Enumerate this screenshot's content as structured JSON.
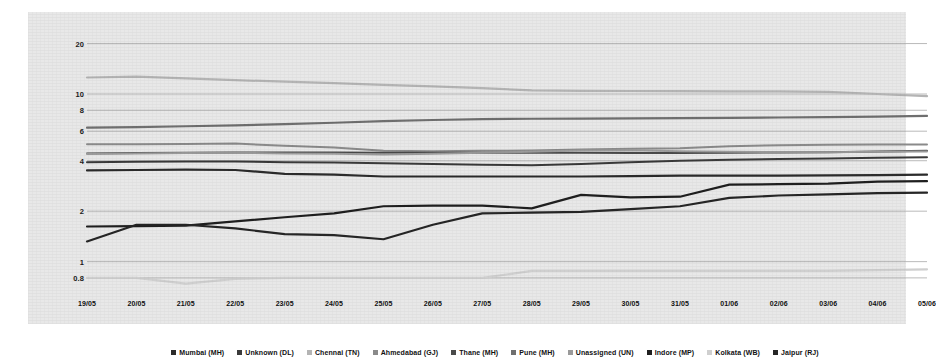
{
  "chart_data": {
    "type": "line",
    "title": "",
    "subtitle": "",
    "xlabel": "",
    "ylabel": "",
    "yscale": "log",
    "ylim": [
      0.65,
      21
    ],
    "grid": true,
    "legend_position": "bottom",
    "y_ticks": [
      {
        "label": "20",
        "value": 20
      },
      {
        "label": "10",
        "value": 10
      },
      {
        "label": "8",
        "value": 8
      },
      {
        "label": "6",
        "value": 6
      },
      {
        "label": "4",
        "value": 4
      },
      {
        "label": "2",
        "value": 2
      },
      {
        "label": "1",
        "value": 1
      },
      {
        "label": "0.8",
        "value": 0.8
      }
    ],
    "categories": [
      "19/05",
      "20/05",
      "21/05",
      "22/05",
      "23/05",
      "24/05",
      "25/05",
      "26/05",
      "27/05",
      "28/05",
      "29/05",
      "30/05",
      "31/05",
      "01/06",
      "02/06",
      "03/06",
      "04/06",
      "05/06"
    ],
    "series": [
      {
        "name": "Mumbai (MH)",
        "color": "#2b2b2b",
        "width": 2.2,
        "values": [
          3.5,
          3.52,
          3.54,
          3.52,
          3.34,
          3.3,
          3.22,
          3.22,
          3.22,
          3.22,
          3.22,
          3.24,
          3.26,
          3.26,
          3.26,
          3.27,
          3.28,
          3.3
        ]
      },
      {
        "name": "Unknown (DL)",
        "color": "#3a3a3a",
        "width": 2.0,
        "values": [
          3.92,
          3.94,
          3.96,
          3.96,
          3.92,
          3.9,
          3.86,
          3.82,
          3.78,
          3.76,
          3.82,
          3.92,
          4.0,
          4.06,
          4.1,
          4.12,
          4.16,
          4.2
        ]
      },
      {
        "name": "Chennai (TN)",
        "color": "#b4b4b4",
        "width": 2.2,
        "values": [
          12.55,
          12.7,
          12.4,
          12.1,
          11.85,
          11.6,
          11.35,
          11.1,
          10.85,
          10.5,
          10.45,
          10.42,
          10.4,
          10.38,
          10.36,
          10.3,
          10.0,
          9.72
        ]
      },
      {
        "name": "Ahmedabad (GJ)",
        "color": "#8a8a8a",
        "width": 2.0,
        "values": [
          5.02,
          5.02,
          5.04,
          5.06,
          4.92,
          4.8,
          4.58,
          4.55,
          4.58,
          4.6,
          4.66,
          4.72,
          4.74,
          4.88,
          4.95,
          4.98,
          5.0,
          5.0
        ]
      },
      {
        "name": "Thane (MH)",
        "color": "#4a4a4a",
        "width": 2.0,
        "values": [
          4.42,
          4.44,
          4.46,
          4.48,
          4.48,
          4.48,
          4.46,
          4.46,
          4.46,
          4.46,
          4.46,
          4.44,
          4.44,
          4.46,
          4.48,
          4.5,
          4.54,
          4.58
        ]
      },
      {
        "name": "Pune (MH)",
        "color": "#6f6f6f",
        "width": 2.2,
        "values": [
          6.3,
          6.34,
          6.42,
          6.5,
          6.62,
          6.74,
          6.9,
          7.0,
          7.08,
          7.12,
          7.14,
          7.16,
          7.18,
          7.2,
          7.24,
          7.28,
          7.34,
          7.4
        ]
      },
      {
        "name": "Unassigned (UN)",
        "color": "#9a9a9a",
        "width": 2.0,
        "values": [
          4.4,
          4.42,
          4.44,
          4.46,
          4.42,
          4.4,
          4.36,
          4.4,
          4.46,
          4.52,
          4.6,
          4.62,
          4.56,
          4.52,
          4.5,
          4.5,
          4.52,
          4.54
        ]
      },
      {
        "name": "Indore (MP)",
        "color": "#1f1f1f",
        "width": 2.2,
        "values": [
          1.62,
          1.63,
          1.64,
          1.74,
          1.84,
          1.94,
          2.14,
          2.16,
          2.16,
          2.08,
          2.5,
          2.42,
          2.44,
          2.88,
          2.9,
          2.92,
          3.0,
          3.02
        ]
      },
      {
        "name": "Kolkata (WB)",
        "color": "#cfcfcf",
        "width": 2.2,
        "values": [
          0.8,
          0.8,
          0.74,
          0.79,
          0.8,
          0.8,
          0.8,
          0.8,
          0.8,
          0.88,
          0.88,
          0.88,
          0.88,
          0.88,
          0.88,
          0.88,
          0.89,
          0.9
        ]
      },
      {
        "name": "Jaipur (RJ)",
        "color": "#262626",
        "width": 2.2,
        "values": [
          1.32,
          1.66,
          1.66,
          1.58,
          1.46,
          1.44,
          1.36,
          1.66,
          1.94,
          1.96,
          1.98,
          2.06,
          2.14,
          2.4,
          2.48,
          2.52,
          2.56,
          2.58
        ]
      }
    ]
  }
}
